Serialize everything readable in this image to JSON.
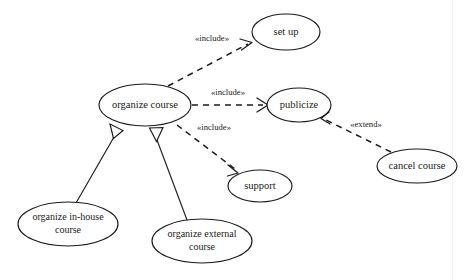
{
  "diagram": {
    "type": "uml-use-case",
    "canvas": {
      "width": 471,
      "height": 280,
      "background": "#ffffff"
    },
    "stroke_color": "#1b1b1b",
    "fill_color": "#ffffff"
  },
  "use_cases": [
    {
      "id": "set-up",
      "label": "set up",
      "lines": [
        "set up"
      ],
      "cx": 286,
      "cy": 32,
      "rx": 34,
      "ry": 18,
      "font_size": 10.5
    },
    {
      "id": "organize-course",
      "label": "organize course",
      "lines": [
        "organize course"
      ],
      "cx": 145,
      "cy": 105,
      "rx": 46,
      "ry": 21,
      "font_size": 10.5
    },
    {
      "id": "publicize",
      "label": "publicize",
      "lines": [
        "publicize"
      ],
      "cx": 299,
      "cy": 105,
      "rx": 32,
      "ry": 17,
      "font_size": 10.5
    },
    {
      "id": "support",
      "label": "support",
      "lines": [
        "support"
      ],
      "cx": 260,
      "cy": 186,
      "rx": 32,
      "ry": 16,
      "font_size": 10.5
    },
    {
      "id": "cancel-course",
      "label": "cancel course",
      "lines": [
        "cancel course"
      ],
      "cx": 417,
      "cy": 166,
      "rx": 40,
      "ry": 17,
      "font_size": 10.5
    },
    {
      "id": "organize-in-house-course",
      "label": "organize in-house course",
      "lines": [
        "organize in-house",
        "course"
      ],
      "cx": 68,
      "cy": 224,
      "rx": 50,
      "ry": 22,
      "font_size": 10
    },
    {
      "id": "organize-external-course",
      "label": "organize external course",
      "lines": [
        "organize external",
        "course"
      ],
      "cx": 202,
      "cy": 241,
      "rx": 50,
      "ry": 22,
      "font_size": 10
    }
  ],
  "relationships": [
    {
      "id": "include-set-up",
      "kind": "include",
      "stereotype": "«include»",
      "source": "organize-course",
      "target": "set-up",
      "path": "M 168 86 L 250 43",
      "label_x": 212,
      "label_y": 39
    },
    {
      "id": "include-publicize",
      "kind": "include",
      "stereotype": "«include»",
      "source": "organize-course",
      "target": "publicize",
      "path": "M 192 105 L 265 105",
      "label_x": 228,
      "label_y": 93
    },
    {
      "id": "include-support",
      "kind": "include",
      "stereotype": "«include»",
      "source": "organize-course",
      "target": "support",
      "path": "M 176 126 L 236 171",
      "label_x": 214,
      "label_y": 128
    },
    {
      "id": "extend-publicize",
      "kind": "extend",
      "stereotype": "«extend»",
      "source": "cancel-course",
      "target": "publicize",
      "path": "M 390 154 L 323 119",
      "label_x": 365,
      "label_y": 125
    },
    {
      "id": "generalization-in-house",
      "kind": "generalization",
      "stereotype": "",
      "source": "organize-in-house-course",
      "target": "organize-course",
      "path": "M 76 202 L 119 128",
      "label_x": 0,
      "label_y": 0
    },
    {
      "id": "generalization-external",
      "kind": "generalization",
      "stereotype": "",
      "source": "organize-external-course",
      "target": "organize-course",
      "path": "M 186 219 L 152 131",
      "label_x": 0,
      "label_y": 0
    }
  ]
}
